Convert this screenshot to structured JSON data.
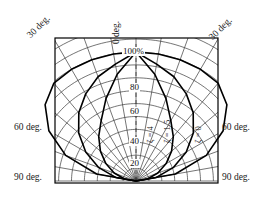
{
  "figure": {
    "type": "polar-contour-diagram",
    "frame": {
      "x": 55,
      "y": 38,
      "width": 163,
      "height": 145
    },
    "pole": {
      "x": 136,
      "y": 181
    }
  },
  "angle_labels": {
    "top_left": "30 deg.",
    "top_center": "0 deg.",
    "top_right": "30 deg.",
    "mid_left": "60 deg.",
    "mid_right": "60 deg.",
    "bottom_left": "90 deg.",
    "bottom_right": "90 deg."
  },
  "radial_labels": [
    {
      "text": "100%",
      "value": 100,
      "y": 52
    },
    {
      "text": "80",
      "value": 80,
      "y": 88
    },
    {
      "text": "60",
      "value": 60,
      "y": 112
    },
    {
      "text": "40",
      "value": 40,
      "y": 142
    },
    {
      "text": "20",
      "value": 20,
      "y": 164
    }
  ],
  "curves": [
    {
      "label": "ζ = 4",
      "zeta": 4,
      "lx": 155,
      "ly": 133
    },
    {
      "label": "ζ = 1.5",
      "zeta": 1.5,
      "lx": 172,
      "ly": 133
    },
    {
      "label": "ζ = 0",
      "zeta": 0,
      "lx": 203,
      "ly": 133
    }
  ],
  "chart_data": {
    "type": "line",
    "title": "",
    "xlabel": "",
    "ylabel": "",
    "coordinate_system": "polar (pole at bottom-centre, 0 deg. up)",
    "angle_ticks_deg": [
      -90,
      -80,
      -70,
      -60,
      -50,
      -40,
      -30,
      -20,
      -10,
      0,
      10,
      20,
      30,
      40,
      50,
      60,
      70,
      80,
      90
    ],
    "angle_tick_labels": [
      "90 deg.",
      "60 deg.",
      "30 deg.",
      "0 deg.",
      "30 deg.",
      "60 deg.",
      "90 deg."
    ],
    "radial_ticks": [
      20,
      40,
      60,
      80,
      100
    ],
    "radial_tick_labels": [
      "20",
      "40",
      "60",
      "80",
      "100%"
    ],
    "rlim": [
      0,
      100
    ],
    "grid": true,
    "legend": "inline curve annotations",
    "series": [
      {
        "name": "ζ = 0",
        "theta_deg": [
          -90,
          -80,
          -70,
          -60,
          -50,
          -40,
          -30,
          -20,
          -10,
          0,
          10,
          20,
          30,
          40,
          50,
          60,
          70,
          80,
          90
        ],
        "r_percent": [
          0,
          31,
          58,
          78,
          92,
          99,
          100,
          100,
          100,
          100,
          100,
          100,
          100,
          99,
          92,
          78,
          58,
          31,
          0
        ]
      },
      {
        "name": "ζ = 1.5",
        "theta_deg": [
          -90,
          -80,
          -70,
          -60,
          -50,
          -40,
          -30,
          -20,
          -10,
          0,
          10,
          20,
          30,
          40,
          50,
          60,
          70,
          80,
          90
        ],
        "r_percent": [
          0,
          16,
          31,
          45,
          58,
          69,
          78,
          86,
          92,
          100,
          92,
          86,
          78,
          69,
          58,
          45,
          31,
          16,
          0
        ]
      },
      {
        "name": "ζ = 4",
        "theta_deg": [
          -90,
          -80,
          -70,
          -60,
          -50,
          -40,
          -30,
          -20,
          -10,
          0,
          10,
          20,
          30,
          40,
          50,
          60,
          70,
          80,
          90
        ],
        "r_percent": [
          0,
          9,
          18,
          27,
          36,
          45,
          54,
          68,
          84,
          100,
          84,
          68,
          54,
          45,
          36,
          27,
          18,
          9,
          0
        ]
      }
    ]
  }
}
